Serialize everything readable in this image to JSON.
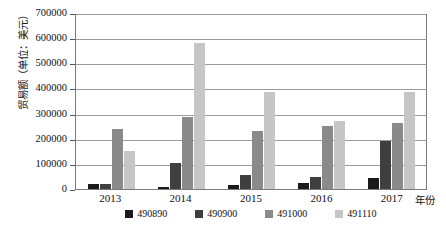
{
  "chart_data": {
    "type": "bar",
    "title": "",
    "xlabel": "年份",
    "ylabel": "贸易额（单位：美元）",
    "categories": [
      "2013",
      "2014",
      "2015",
      "2016",
      "2017"
    ],
    "series": [
      {
        "name": "490890",
        "color": "#1a1a1a",
        "values": [
          18000,
          10000,
          15000,
          22000,
          45000
        ]
      },
      {
        "name": "490900",
        "color": "#3f3f3f",
        "values": [
          20000,
          105000,
          57000,
          48000,
          190000
        ]
      },
      {
        "name": "491000",
        "color": "#8a8a8a",
        "values": [
          237000,
          285000,
          232000,
          250000,
          262000
        ]
      },
      {
        "name": "491110",
        "color": "#c6c6c6",
        "values": [
          150000,
          580000,
          385000,
          272000,
          385000
        ]
      }
    ],
    "yticks": [
      0,
      100000,
      200000,
      300000,
      400000,
      500000,
      600000,
      700000
    ],
    "ylim": [
      0,
      700000
    ],
    "grid": true,
    "legend_position": "bottom"
  }
}
